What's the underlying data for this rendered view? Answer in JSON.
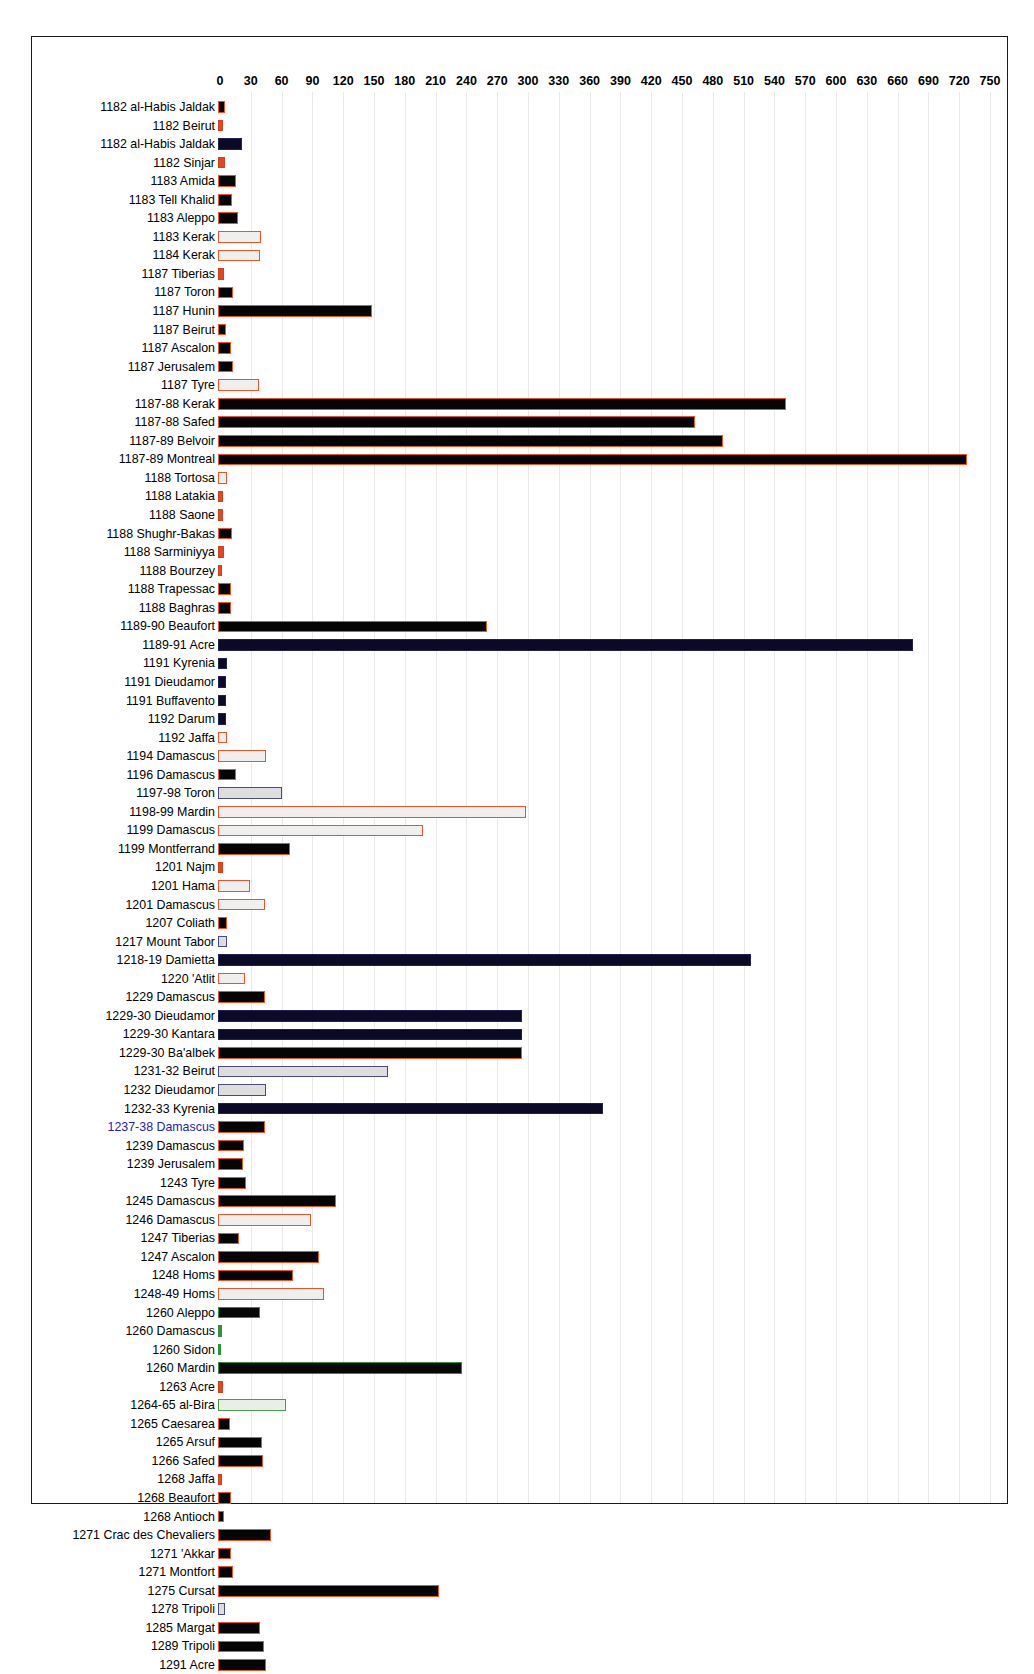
{
  "chart_data": {
    "type": "bar",
    "orientation": "horizontal",
    "title": "",
    "xlabel": "Days",
    "ylabel": "",
    "xlim": [
      0,
      765
    ],
    "xticks": [
      0,
      30,
      60,
      90,
      120,
      150,
      180,
      210,
      240,
      270,
      300,
      330,
      360,
      390,
      420,
      450,
      480,
      510,
      540,
      570,
      600,
      630,
      660,
      690,
      720,
      750
    ],
    "grid": true,
    "legend": "none",
    "colors": {
      "black_fill": "#050505",
      "orange_border": "#e8552a",
      "navy_fill": "#0d0d2e",
      "purple_border": "#7b78b8",
      "green_border": "#2f8f3a",
      "blue_label": "#2222bb",
      "gridline": "#e9e9ea"
    },
    "categories": [
      "1182 al-Habis Jaldak",
      "1182 Beirut",
      "1182 al-Habis Jaldak",
      "1182 Sinjar",
      "1183 Amida",
      "1183 Tell Khalid",
      "1183 Aleppo",
      "1183 Kerak",
      "1184 Kerak",
      "1187 Tiberias",
      "1187 Toron",
      "1187 Hunin",
      "1187 Beirut",
      "1187 Ascalon",
      "1187 Jerusalem",
      "1187 Tyre",
      "1187-88 Kerak",
      "1187-88 Safed",
      "1187-89 Belvoir",
      "1187-89 Montreal",
      "1188 Tortosa",
      "1188 Latakia",
      "1188 Saone",
      "1188 Shughr-Bakas",
      "1188 Sarminiyya",
      "1188 Bourzey",
      "1188 Trapessac",
      "1188 Baghras",
      "1189-90 Beaufort",
      "1189-91 Acre",
      "1191 Kyrenia",
      "1191 Dieudamor",
      "1191 Buffavento",
      "1192 Darum",
      "1192 Jaffa",
      "1194 Damascus",
      "1196 Damascus",
      "1197-98 Toron",
      "1198-99 Mardin",
      "1199 Damascus",
      "1199 Montferrand",
      "1201 Najm",
      "1201 Hama",
      "1201 Damascus",
      "1207 Coliath",
      "1217 Mount Tabor",
      "1218-19 Damietta",
      "1220 'Atlit",
      "1229 Damascus",
      "1229-30 Dieudamor",
      "1229-30 Kantara",
      "1229-30 Ba'albek",
      "1231-32 Beirut",
      "1232 Dieudamor",
      "1232-33 Kyrenia",
      "1237-38 Damascus",
      "1239 Damascus",
      "1239 Jerusalem",
      "1243 Tyre",
      "1245 Damascus",
      "1246 Damascus",
      "1247 Tiberias",
      "1247 Ascalon",
      "1248 Homs",
      "1248-49 Homs",
      "1260 Aleppo",
      "1260 Damascus",
      "1260 Sidon",
      "1260 Mardin",
      "1263 Acre",
      "1264-65 al-Bira",
      "1265 Caesarea",
      "1265 Arsuf",
      "1266 Safed",
      "1268 Jaffa",
      "1268 Beaufort",
      "1268 Antioch",
      "1271 Crac des Chevaliers",
      "1271 'Akkar",
      "1271 Montfort",
      "1275 Cursat",
      "1278 Tripoli",
      "1285 Margat",
      "1289 Tripoli",
      "1291 Acre"
    ],
    "values": [
      7,
      5,
      23,
      7,
      18,
      14,
      19,
      42,
      41,
      6,
      15,
      150,
      8,
      13,
      15,
      40,
      553,
      465,
      492,
      730,
      9,
      5,
      5,
      14,
      6,
      4,
      13,
      13,
      262,
      677,
      9,
      8,
      8,
      8,
      9,
      47,
      18,
      62,
      300,
      200,
      70,
      5,
      31,
      46,
      9,
      9,
      519,
      26,
      46,
      296,
      296,
      296,
      166,
      47,
      375,
      46,
      25,
      24,
      27,
      115,
      91,
      20,
      98,
      73,
      103,
      41,
      4,
      3,
      238,
      5,
      66,
      12,
      43,
      44,
      4,
      13,
      6,
      52,
      13,
      15,
      215,
      7,
      41,
      45,
      47
    ],
    "styles": [
      "black",
      "redthin",
      "darknav",
      "redthin",
      "black",
      "black",
      "black",
      "hollowO",
      "hollowO",
      "redthin",
      "black",
      "black",
      "black",
      "black",
      "black",
      "hollowO",
      "black",
      "black",
      "black",
      "black",
      "hollowO",
      "redthin",
      "redthin",
      "black",
      "redthin",
      "redthin",
      "black",
      "black",
      "black",
      "darknav",
      "darknav",
      "darknav",
      "darknav",
      "darknav",
      "hollowO",
      "hollowO",
      "black",
      "hollowB",
      "hollowO",
      "hollowO",
      "black",
      "redthin",
      "hollowO",
      "hollowO",
      "black",
      "hollowB",
      "darknav",
      "hollowO",
      "black",
      "darknav",
      "darknav",
      "black",
      "hollowB",
      "hollowB",
      "darknav",
      "black",
      "black",
      "black",
      "black",
      "black",
      "hollowO",
      "black",
      "black",
      "black",
      "hollowO",
      "greenE",
      "greenS",
      "greenS",
      "greenE",
      "redthin",
      "hollowG",
      "black",
      "black",
      "black",
      "redthin",
      "black",
      "black",
      "black",
      "black",
      "black",
      "black",
      "hollowB",
      "black",
      "black",
      "black"
    ],
    "label_colors": [
      "black",
      "black",
      "black",
      "black",
      "black",
      "black",
      "black",
      "black",
      "black",
      "black",
      "black",
      "black",
      "black",
      "black",
      "black",
      "black",
      "black",
      "black",
      "black",
      "black",
      "black",
      "black",
      "black",
      "black",
      "black",
      "black",
      "black",
      "black",
      "black",
      "black",
      "black",
      "black",
      "black",
      "black",
      "black",
      "black",
      "black",
      "black",
      "black",
      "black",
      "black",
      "black",
      "black",
      "black",
      "black",
      "black",
      "black",
      "black",
      "black",
      "black",
      "black",
      "black",
      "black",
      "black",
      "black",
      "blue",
      "black",
      "black",
      "black",
      "black",
      "black",
      "black",
      "black",
      "black",
      "black",
      "black",
      "black",
      "black",
      "black",
      "black",
      "black",
      "black",
      "black",
      "black",
      "black",
      "black",
      "black",
      "black",
      "black",
      "black",
      "black",
      "black",
      "black",
      "black",
      "black"
    ]
  }
}
